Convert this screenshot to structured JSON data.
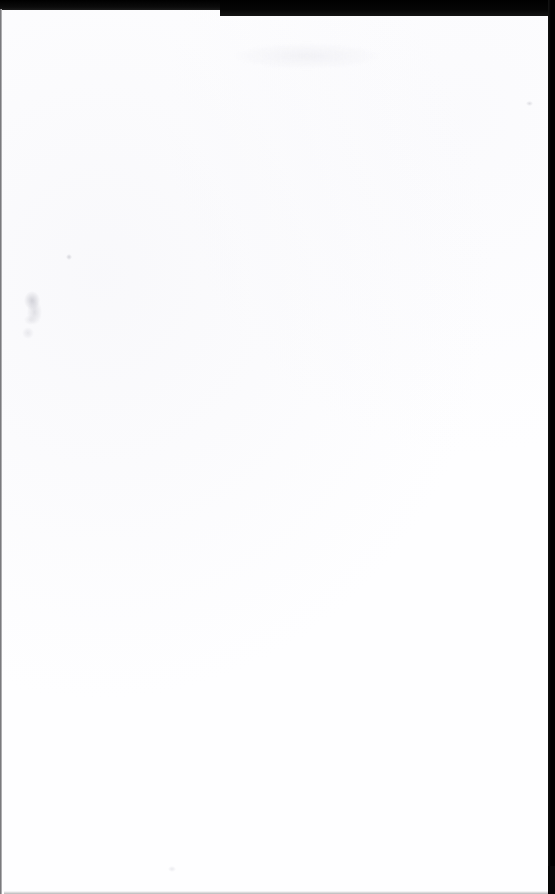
{
  "document": {
    "kind": "scanned-page",
    "page_text": "",
    "has_visible_text": false,
    "orientation": "portrait",
    "width_px": 555,
    "height_px": 894
  },
  "colors": {
    "paper": "#fefeff",
    "scanner_backdrop": "#070707",
    "top_band": "#000000",
    "right_strip": "#000000",
    "left_edge_line": "#b9b9bd",
    "artifact_grey": "#c8c8d0"
  },
  "regions": {
    "top_dark_band": {
      "label": "",
      "height_px": 10
    },
    "right_dark_strip": {
      "label": "",
      "width_px": 7,
      "ends_at_y_px": 866
    },
    "left_edge_line": {
      "label": "",
      "width_px": 2
    },
    "paper_sheet": {
      "label": "",
      "rounded_corner_x_px": 215
    }
  },
  "artifacts": [
    {
      "name": "smudge-upper-left",
      "x": 30,
      "y": 295
    },
    {
      "name": "speck-upper-left",
      "x": 66,
      "y": 247
    },
    {
      "name": "speck-upper-right",
      "x": 527,
      "y": 95
    },
    {
      "name": "speck-bottom",
      "x": 170,
      "y": 860
    }
  ]
}
